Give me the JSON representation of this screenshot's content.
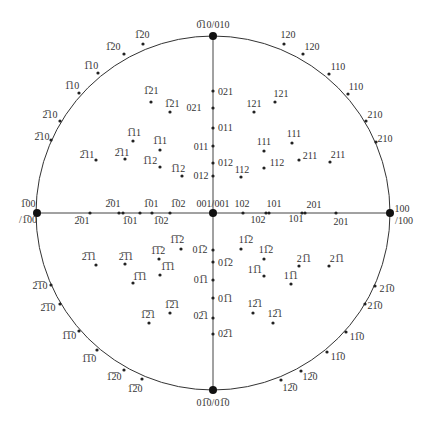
{
  "diagram": {
    "type": "stereographic-projection",
    "center": [
      213,
      213
    ],
    "radius": 177,
    "line_color": "#333333",
    "point_color": "#222222",
    "poles": [
      {
        "name": "top-pole",
        "x": 213,
        "y": 36,
        "label": "0̅10/010",
        "lx": 213,
        "ly": 28,
        "anchor": "middle"
      },
      {
        "name": "bottom-pole",
        "x": 213,
        "y": 390,
        "label": "01̅0/01̅0",
        "lx": 213,
        "ly": 406,
        "anchor": "middle"
      },
      {
        "name": "left-pole",
        "x": 37,
        "y": 213,
        "label": "1̅00",
        "lx": 28,
        "ly": 207,
        "anchor": "middle",
        "label2": "/1̅00",
        "lx2": 28,
        "ly2": 223
      },
      {
        "name": "right-pole",
        "x": 390,
        "y": 213,
        "label": "100",
        "lx": 402,
        "ly": 212,
        "anchor": "middle",
        "label2": "/100",
        "lx2": 404,
        "ly2": 224
      },
      {
        "name": "center-pole",
        "x": 213,
        "y": 213,
        "label": "001/001",
        "lx": 213,
        "ly": 207,
        "anchor": "middle"
      }
    ],
    "points": [
      {
        "x": 143,
        "y": 44,
        "label": "1̅20",
        "lx": 142,
        "ly": 38
      },
      {
        "x": 124,
        "y": 54,
        "label": "1̅20",
        "lx": 113,
        "ly": 50
      },
      {
        "x": 98,
        "y": 73,
        "label": "1̅10",
        "lx": 91,
        "ly": 69
      },
      {
        "x": 79,
        "y": 93,
        "label": "1̅10",
        "lx": 72,
        "ly": 89
      },
      {
        "x": 60,
        "y": 121,
        "label": "2̅10",
        "lx": 50,
        "ly": 118
      },
      {
        "x": 51,
        "y": 140,
        "label": "2̅10",
        "lx": 42,
        "ly": 140
      },
      {
        "x": 284,
        "y": 44,
        "label": "120",
        "lx": 288,
        "ly": 38
      },
      {
        "x": 303,
        "y": 54,
        "label": "120",
        "lx": 312,
        "ly": 50
      },
      {
        "x": 329,
        "y": 74,
        "label": "110",
        "lx": 338,
        "ly": 70
      },
      {
        "x": 348,
        "y": 94,
        "label": "110",
        "lx": 356,
        "ly": 90
      },
      {
        "x": 366,
        "y": 121,
        "label": "210",
        "lx": 375,
        "ly": 118
      },
      {
        "x": 376,
        "y": 142,
        "label": "210",
        "lx": 385,
        "ly": 142
      },
      {
        "x": 51,
        "y": 285,
        "label": "2̅1̅0",
        "lx": 40,
        "ly": 289
      },
      {
        "x": 60,
        "y": 304,
        "label": "2̅1̅0",
        "lx": 48,
        "ly": 311
      },
      {
        "x": 79,
        "y": 331,
        "label": "1̅1̅0",
        "lx": 69,
        "ly": 339
      },
      {
        "x": 97,
        "y": 350,
        "label": "1̅1̅0",
        "lx": 89,
        "ly": 362
      },
      {
        "x": 124,
        "y": 370,
        "label": "1̅2̅0",
        "lx": 114,
        "ly": 380
      },
      {
        "x": 142,
        "y": 379,
        "label": "1̅2̅0",
        "lx": 135,
        "ly": 392
      },
      {
        "x": 375,
        "y": 286,
        "label": "21̅0",
        "lx": 387,
        "ly": 292
      },
      {
        "x": 365,
        "y": 304,
        "label": "21̅0",
        "lx": 375,
        "ly": 309
      },
      {
        "x": 346,
        "y": 332,
        "label": "11̅0",
        "lx": 357,
        "ly": 340
      },
      {
        "x": 327,
        "y": 352,
        "label": "11̅0",
        "lx": 338,
        "ly": 360
      },
      {
        "x": 301,
        "y": 371,
        "label": "12̅0",
        "lx": 310,
        "ly": 380
      },
      {
        "x": 281,
        "y": 380,
        "label": "12̅0",
        "lx": 290,
        "ly": 391
      },
      {
        "x": 213,
        "y": 91,
        "label": "021",
        "lx": 218,
        "ly": 95,
        "anchor": "start"
      },
      {
        "x": 213,
        "y": 108,
        "label": "021",
        "lx": 194,
        "ly": 111
      },
      {
        "x": 213,
        "y": 128,
        "label": "011",
        "lx": 218,
        "ly": 131,
        "anchor": "start"
      },
      {
        "x": 213,
        "y": 146,
        "label": "011",
        "lx": 201,
        "ly": 150
      },
      {
        "x": 213,
        "y": 163,
        "label": "012",
        "lx": 218,
        "ly": 166,
        "anchor": "start"
      },
      {
        "x": 213,
        "y": 176,
        "label": "012",
        "lx": 201,
        "ly": 179
      },
      {
        "x": 151,
        "y": 102,
        "label": "1̅21",
        "lx": 151,
        "ly": 94
      },
      {
        "x": 170,
        "y": 112,
        "label": "1̅21",
        "lx": 172,
        "ly": 107
      },
      {
        "x": 133,
        "y": 141,
        "label": "1̅11",
        "lx": 134,
        "ly": 136
      },
      {
        "x": 160,
        "y": 150,
        "label": "1̅11",
        "lx": 160,
        "ly": 144
      },
      {
        "x": 96,
        "y": 160,
        "label": "2̅11",
        "lx": 87,
        "ly": 158
      },
      {
        "x": 125,
        "y": 159,
        "label": "2̅11",
        "lx": 122,
        "ly": 156
      },
      {
        "x": 160,
        "y": 167,
        "label": "1̅12",
        "lx": 150,
        "ly": 164
      },
      {
        "x": 182,
        "y": 176,
        "label": "1̅12",
        "lx": 178,
        "ly": 172
      },
      {
        "x": 140,
        "y": 213,
        "label": "1̅02",
        "lx": 178,
        "ly": 207
      },
      {
        "x": 152,
        "y": 213,
        "label": "1̅02",
        "lx": 161,
        "ly": 224
      },
      {
        "x": 119,
        "y": 213,
        "label": "1̅01",
        "lx": 151,
        "ly": 207
      },
      {
        "x": 123,
        "y": 213,
        "label": "1̅01",
        "lx": 130,
        "ly": 224
      },
      {
        "x": 90,
        "y": 213,
        "label": "2̅01",
        "lx": 113,
        "ly": 207
      },
      {
        "x": 170,
        "y": 213,
        "label": "2̅01",
        "lx": 82,
        "ly": 224
      },
      {
        "x": 275,
        "y": 102,
        "label": "121",
        "lx": 281,
        "ly": 97
      },
      {
        "x": 254,
        "y": 112,
        "label": "121",
        "lx": 254,
        "ly": 107
      },
      {
        "x": 292,
        "y": 143,
        "label": "111",
        "lx": 294,
        "ly": 137
      },
      {
        "x": 264,
        "y": 151,
        "label": "111",
        "lx": 264,
        "ly": 145
      },
      {
        "x": 299,
        "y": 160,
        "label": "211",
        "lx": 310,
        "ly": 159
      },
      {
        "x": 330,
        "y": 162,
        "label": "211",
        "lx": 338,
        "ly": 158
      },
      {
        "x": 264,
        "y": 168,
        "label": "112",
        "lx": 277,
        "ly": 166
      },
      {
        "x": 241,
        "y": 177,
        "label": "112",
        "lx": 242,
        "ly": 173
      },
      {
        "x": 243,
        "y": 213,
        "label": "102",
        "lx": 242,
        "ly": 207
      },
      {
        "x": 266,
        "y": 213,
        "label": "101",
        "lx": 274,
        "ly": 207
      },
      {
        "x": 269,
        "y": 213,
        "label": "102",
        "lx": 258,
        "ly": 223
      },
      {
        "x": 302,
        "y": 213,
        "label": "201",
        "lx": 314,
        "ly": 208
      },
      {
        "x": 305,
        "y": 213,
        "label": "101",
        "lx": 296,
        "ly": 222
      },
      {
        "x": 336,
        "y": 213,
        "label": "201",
        "lx": 341,
        "ly": 225
      },
      {
        "x": 213,
        "y": 250,
        "label": "01̅2",
        "lx": 200,
        "ly": 253
      },
      {
        "x": 213,
        "y": 262,
        "label": "01̅2",
        "lx": 218,
        "ly": 266,
        "anchor": "start"
      },
      {
        "x": 213,
        "y": 280,
        "label": "01̅1",
        "lx": 201,
        "ly": 283
      },
      {
        "x": 213,
        "y": 298,
        "label": "01̅1",
        "lx": 218,
        "ly": 302,
        "anchor": "start"
      },
      {
        "x": 213,
        "y": 318,
        "label": "02̅1",
        "lx": 201,
        "ly": 319
      },
      {
        "x": 213,
        "y": 334,
        "label": "02̅1",
        "lx": 218,
        "ly": 337,
        "anchor": "start"
      },
      {
        "x": 181,
        "y": 249,
        "label": "1̅1̅2",
        "lx": 177,
        "ly": 243
      },
      {
        "x": 159,
        "y": 259,
        "label": "1̅1̅2",
        "lx": 158,
        "ly": 254
      },
      {
        "x": 160,
        "y": 275,
        "label": "1̅1̅1",
        "lx": 168,
        "ly": 270
      },
      {
        "x": 133,
        "y": 283,
        "label": "1̅1̅1",
        "lx": 140,
        "ly": 280
      },
      {
        "x": 96,
        "y": 265,
        "label": "2̅1̅1",
        "lx": 89,
        "ly": 260
      },
      {
        "x": 125,
        "y": 264,
        "label": "2̅1̅1",
        "lx": 126,
        "ly": 260
      },
      {
        "x": 149,
        "y": 323,
        "label": "1̅2̅1",
        "lx": 148,
        "ly": 318
      },
      {
        "x": 170,
        "y": 313,
        "label": "1̅2̅1",
        "lx": 172,
        "ly": 308
      },
      {
        "x": 241,
        "y": 249,
        "label": "11̅2",
        "lx": 246,
        "ly": 243
      },
      {
        "x": 264,
        "y": 259,
        "label": "11̅2",
        "lx": 266,
        "ly": 253
      },
      {
        "x": 264,
        "y": 276,
        "label": "11̅1",
        "lx": 255,
        "ly": 273
      },
      {
        "x": 291,
        "y": 284,
        "label": "11̅1",
        "lx": 291,
        "ly": 279
      },
      {
        "x": 299,
        "y": 266,
        "label": "21̅1",
        "lx": 304,
        "ly": 262
      },
      {
        "x": 329,
        "y": 266,
        "label": "21̅1",
        "lx": 337,
        "ly": 262
      },
      {
        "x": 253,
        "y": 313,
        "label": "12̅1",
        "lx": 255,
        "ly": 307
      },
      {
        "x": 273,
        "y": 323,
        "label": "12̅1",
        "lx": 275,
        "ly": 317
      }
    ]
  }
}
